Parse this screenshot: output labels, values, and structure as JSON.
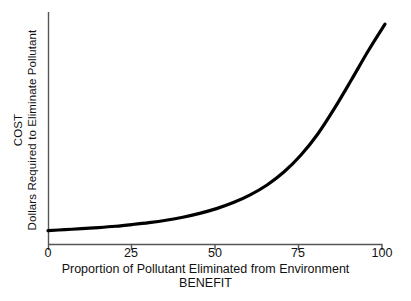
{
  "chart_data": {
    "type": "line",
    "title": "",
    "xlabel": "Proportion of Pollutant Eliminated from Environment",
    "xlabel_sub": "BENEFIT",
    "ylabel": "Dollars Required to Eliminate Pollutant",
    "ylabel_outer": "COST",
    "xlim": [
      0,
      100
    ],
    "ylim": [
      0,
      100
    ],
    "xticks": [
      0,
      25,
      50,
      75,
      100
    ],
    "xtick_labels": [
      "0",
      "25",
      "50",
      "75",
      "100"
    ],
    "yticks": [],
    "ytick_labels": [],
    "grid": false,
    "legend": false,
    "series": [
      {
        "name": "Cost to eliminate pollutant",
        "color": "#000000",
        "linewidth": 3,
        "x": [
          0,
          5,
          10,
          15,
          20,
          25,
          30,
          35,
          40,
          45,
          50,
          55,
          60,
          65,
          70,
          75,
          80,
          85,
          90,
          95,
          100
        ],
        "y": [
          3.0,
          3.4,
          3.9,
          4.4,
          5.0,
          5.8,
          6.7,
          7.8,
          9.2,
          11.0,
          13.2,
          16.0,
          19.6,
          24.2,
          30.2,
          38.0,
          47.8,
          59.8,
          73.0,
          86.5,
          99.0
        ]
      }
    ],
    "axes": {
      "left_spine": true,
      "bottom_spine": true,
      "top_spine": false,
      "right_spine": false,
      "spine_color": "#555555",
      "tick_direction": "out"
    },
    "annotations": []
  },
  "labels": {
    "x_tick_0": "0",
    "x_tick_25": "25",
    "x_tick_50": "50",
    "x_tick_75": "75",
    "x_tick_100": "100",
    "x_axis_title": "Proportion of Pollutant Eliminated from Environment",
    "x_axis_subtitle": "BENEFIT",
    "y_axis_title_inner": "Dollars Required to Eliminate Pollutant",
    "y_axis_title_outer": "COST"
  },
  "colors": {
    "background": "#ffffff",
    "curve": "#000000",
    "axis": "#555555",
    "text": "#111111"
  }
}
